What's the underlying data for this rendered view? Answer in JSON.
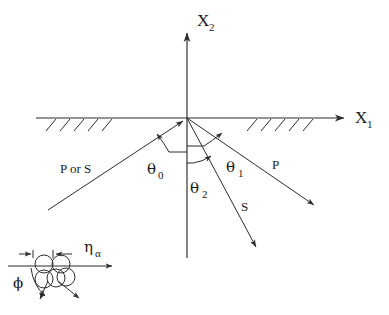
{
  "figure": {
    "kind": "wave-scattering-geometry-diagram",
    "background_color": "#ffffff",
    "line_color": "#2b2b2b",
    "width": 389,
    "height": 315
  },
  "axes": {
    "vertical": {
      "label": "X",
      "subscript": "2",
      "name": "x2-axis",
      "origin": {
        "x": 187,
        "y": 118
      },
      "top": {
        "x": 187,
        "y": 28
      },
      "bottom": {
        "x": 187,
        "y": 258
      }
    },
    "horizontal": {
      "label": "X",
      "subscript": "1",
      "name": "x1-axis",
      "left": {
        "x": 36,
        "y": 118
      },
      "right": {
        "x": 349,
        "y": 118
      }
    }
  },
  "surface": {
    "description": "hatched free surface along the horizontal axis",
    "left_hatch_count": 5,
    "right_hatch_count": 5
  },
  "rays": [
    {
      "id": "incident",
      "label": "P or S",
      "label_x": 60,
      "label_y": 169,
      "from": {
        "x": 48,
        "y": 210
      },
      "to": {
        "x": 187,
        "y": 118
      },
      "arrow_at": "to"
    },
    {
      "id": "reflected-p",
      "label": "P",
      "label_x": 272,
      "label_y": 165,
      "from": {
        "x": 187,
        "y": 118
      },
      "to": {
        "x": 317,
        "y": 207
      },
      "arrow_at": "to"
    },
    {
      "id": "reflected-s",
      "label": "S",
      "label_x": 240,
      "label_y": 207,
      "from": {
        "x": 187,
        "y": 118
      },
      "to": {
        "x": 258,
        "y": 250
      },
      "arrow_at": "to"
    }
  ],
  "angles": [
    {
      "id": "theta0",
      "symbol": "θ",
      "subscript": "0",
      "label_x": 149,
      "label_y": 172,
      "description": "angle of incidence measured from the downward vertical to the incident ray"
    },
    {
      "id": "theta1",
      "symbol": "θ",
      "subscript": "1",
      "label_x": 215,
      "label_y": 172,
      "description": "reflection angle of the P wave measured from the downward vertical"
    },
    {
      "id": "theta2",
      "symbol": "θ",
      "subscript": "2",
      "label_x": 190,
      "label_y": 193,
      "description": "reflection angle of the S wave measured from the downward vertical"
    }
  ],
  "inset": {
    "name": "grain-contact-inset",
    "eta": {
      "symbol": "η",
      "subscript": "α",
      "label_x": 88,
      "label_y": 252
    },
    "phi": {
      "symbol": "ϕ",
      "label_x": 18,
      "label_y": 285
    },
    "upper_circles": 2,
    "lower_circles": 3,
    "baseline": {
      "x1": 8,
      "x2": 118,
      "y": 266
    }
  }
}
